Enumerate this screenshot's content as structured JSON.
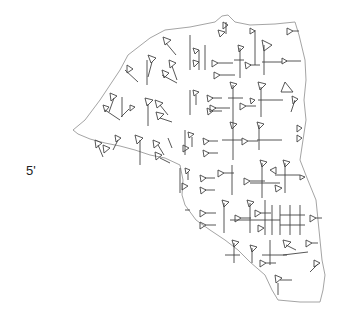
{
  "figure": {
    "line_label": "5'",
    "colors": {
      "background": "#ffffff",
      "outline": "#9a9a9a",
      "signs": "#444444"
    }
  }
}
